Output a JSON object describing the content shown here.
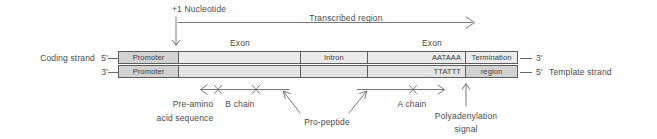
{
  "top_annotations": {
    "start_site_label": "+1 Nucleotide",
    "transcribed_region_label": "Transcribed region",
    "exon1_label": "Exon",
    "exon2_label": "Exon"
  },
  "strands": {
    "coding": {
      "name_label": "Coding strand",
      "left_end_label": "5'",
      "right_end_label": "3'",
      "segments": [
        {
          "id": "promoter",
          "label": "Promoter",
          "align": "c",
          "shaded": true
        },
        {
          "id": "exon1",
          "label": "",
          "align": "c",
          "shaded": false
        },
        {
          "id": "intron",
          "label": "Intron",
          "align": "c",
          "shaded": false
        },
        {
          "id": "exon2",
          "label": "AATAAA",
          "align": "r",
          "shaded": false
        },
        {
          "id": "termination",
          "label": "Termination",
          "align": "c",
          "shaded": false
        }
      ]
    },
    "template": {
      "name_label": "Template strand",
      "left_end_label": "3'",
      "right_end_label": "5'",
      "segments": [
        {
          "id": "promoter",
          "label": "Promoter",
          "align": "c",
          "shaded": true
        },
        {
          "id": "exon1",
          "label": "",
          "align": "c",
          "shaded": false
        },
        {
          "id": "intron",
          "label": "",
          "align": "c",
          "shaded": false
        },
        {
          "id": "exon2",
          "label": "TTATTT",
          "align": "r",
          "shaded": false
        },
        {
          "id": "termination",
          "label": "region",
          "align": "c",
          "shaded": true
        }
      ]
    }
  },
  "bottom_annotations": {
    "pre_amino_label_line1": "Pre-amino",
    "pre_amino_label_line2": "acid sequence",
    "b_chain_label": "B chain",
    "pro_peptide_label": "Pro-peptide",
    "a_chain_label": "A chain",
    "polyadenylation_label_line1": "Polyadenylation",
    "polyadenylation_label_line2": "signal"
  },
  "colors": {
    "line": "#6a6a6a",
    "border": "#5d5d5d",
    "exon_fill": "#ebebeb",
    "template_fill": "#e3e3e3",
    "shaded_fill": "#d2d2d2",
    "text": "#4a4a4a"
  }
}
